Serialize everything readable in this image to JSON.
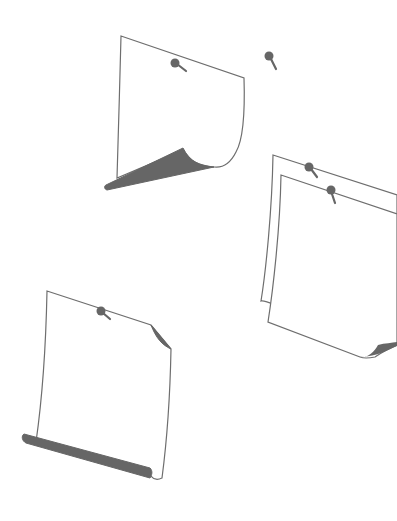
{
  "illustration": {
    "title": "Pinned paper sheets",
    "colors": {
      "background": "#ffffff",
      "outline": "#6e6e6e",
      "shadow": "#666666",
      "pin": "#666666"
    },
    "items": [
      {
        "id": "sheet-top",
        "label": "Sheet with curled bottom-left corner",
        "pins": 1
      },
      {
        "id": "loose-pin",
        "label": "Loose pin",
        "pins": 1
      },
      {
        "id": "sheet-stack",
        "label": "Stack of two sheets",
        "pins": 2
      },
      {
        "id": "sheet-bottom",
        "label": "Sheet with curled bottom edge and folded corner",
        "pins": 1
      }
    ]
  }
}
